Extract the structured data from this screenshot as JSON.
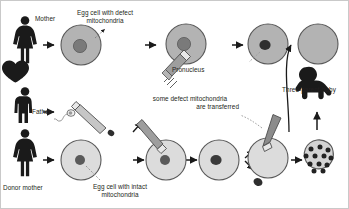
{
  "diagram": {
    "background_color": "#ffffff",
    "colors": {
      "cell_fill": "#b3b3b3",
      "cell_fill_light": "#d9d9d9",
      "cell_stroke": "#4d4d4d",
      "nucleus_dark": "#4d4d4d",
      "nucleus_light": "#808080",
      "pronucleus": "#333333",
      "silhouette": "#1a1a1a",
      "pipette_fill": "#a6a6a6",
      "pipette_stroke": "#4d4d4d",
      "arrow": "#1a1a1a",
      "leader_line": "#808080"
    },
    "labels": {
      "mother": "Mother",
      "father": "Father",
      "donor_mother": "Donor mother",
      "egg_defect": "Egg cell with defect\nmitochondria",
      "egg_defect_line1": "Egg cell with defect",
      "egg_defect_line2": "mitochondria",
      "egg_intact_line1": "Egg cell with intact",
      "egg_intact_line2": "mitochondria",
      "pronucleus": "Pronucleus",
      "transferred_line1": "some defect mitochondria",
      "transferred_line2": "are transferred",
      "baby": "Three-parent-baby"
    },
    "icons": {
      "mother": "female-silhouette-icon",
      "father": "male-silhouette-icon",
      "donor_mother": "female-silhouette-icon",
      "heart": "heart-icon",
      "baby": "crawling-baby-silhouette-icon",
      "sperm": "sperm-cell-icon",
      "pipette": "micropipette-icon",
      "arrow": "arrow-right-icon"
    },
    "row_mother": {
      "row_label": "Mother",
      "steps": [
        {
          "name": "mother-figure",
          "kind": "silhouette"
        },
        {
          "name": "mother-egg-cell",
          "kind": "cell",
          "note": "Egg cell with defect mitochondria"
        },
        {
          "name": "mother-egg-cell-enucleation",
          "kind": "cell-with-pipette"
        },
        {
          "name": "enucleated-mother-egg",
          "kind": "cell-empty"
        }
      ]
    },
    "row_father": {
      "row_label": "Father",
      "steps": [
        {
          "name": "father-figure",
          "kind": "silhouette"
        },
        {
          "name": "sperm-in-pipette",
          "kind": "sperm-pipette"
        }
      ]
    },
    "row_donor": {
      "row_label": "Donor mother",
      "steps": [
        {
          "name": "donor-mother-figure",
          "kind": "silhouette"
        },
        {
          "name": "donor-egg-cell",
          "kind": "cell",
          "note": "Egg cell with intact mitochondria"
        },
        {
          "name": "donor-egg-enucleation",
          "kind": "cell-with-pipette"
        },
        {
          "name": "donor-egg-enucleated",
          "kind": "cell-with-pronucleus"
        },
        {
          "name": "discarded-nucleus",
          "kind": "free-nucleus"
        },
        {
          "name": "reconstructed-egg-injection",
          "kind": "cell-with-pipette"
        },
        {
          "name": "blastocyst",
          "kind": "embryo-cluster"
        }
      ]
    },
    "result": {
      "name": "three-parent-baby",
      "label": "Three-parent-baby"
    }
  }
}
